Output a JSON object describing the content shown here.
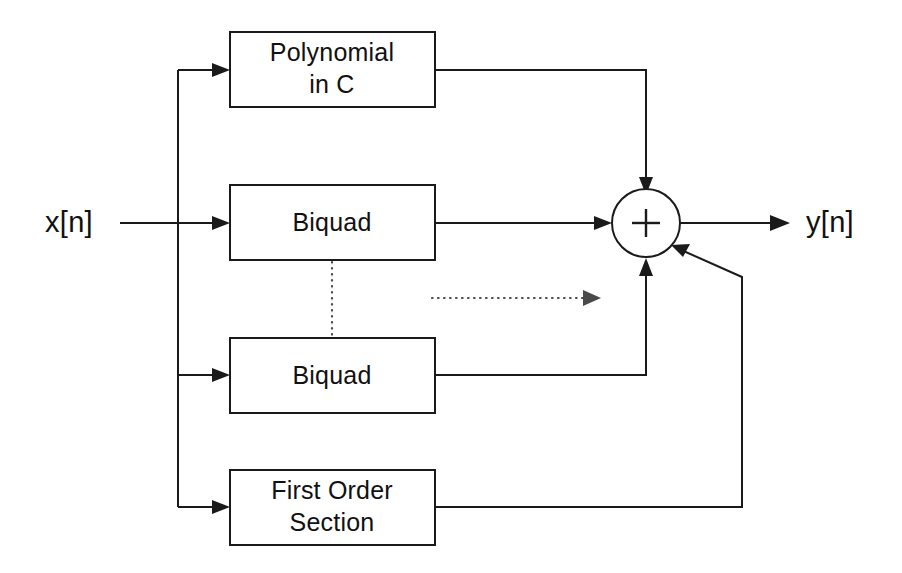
{
  "diagram": {
    "background_color": "#ffffff",
    "line_color": "#1a1a1a",
    "dotted_color": "#4a4a4a",
    "input": {
      "label": "x[n]",
      "name": "input-signal-label"
    },
    "output": {
      "label": "y[n]",
      "name": "output-signal-label"
    },
    "summing_junction": {
      "symbol": "+",
      "name": "summing-junction",
      "inputs": 4
    },
    "blocks": [
      {
        "id": "polynomial-in-c",
        "line1": "Polynomial",
        "line2": "in C",
        "lines": 2
      },
      {
        "id": "biquad-first",
        "line1": "Biquad",
        "line2": "",
        "lines": 1
      },
      {
        "id": "biquad-last",
        "line1": "Biquad",
        "line2": "",
        "lines": 1
      },
      {
        "id": "first-order-section",
        "line1": "First Order",
        "line2": "Section",
        "lines": 2
      }
    ],
    "ellipsis": {
      "vertical_label": "vertical-ellipsis-dotted-line",
      "horizontal_label": "horizontal-ellipsis-dotted-arrow"
    }
  }
}
